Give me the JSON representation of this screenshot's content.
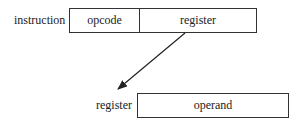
{
  "diagram": {
    "instruction": {
      "label": "instruction",
      "fields": [
        {
          "name": "opcode"
        },
        {
          "name": "register"
        }
      ]
    },
    "register": {
      "label": "register",
      "fields": [
        {
          "name": "operand"
        }
      ]
    },
    "arrow": {
      "from": "instruction.register",
      "to": "register"
    }
  }
}
